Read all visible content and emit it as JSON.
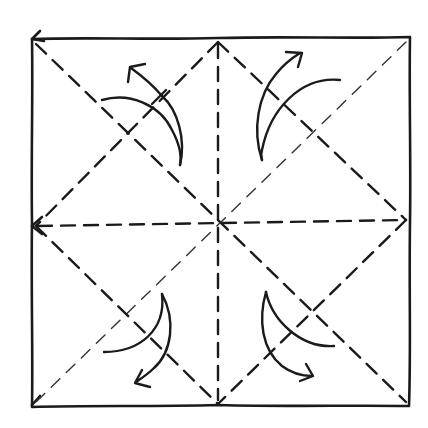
{
  "diagram": {
    "type": "origami-crease-pattern",
    "colors": {
      "ink": "#1a1a1a",
      "paper": "#ffffff"
    },
    "square": {
      "x1": 32,
      "y1": 38,
      "x2": 410,
      "y2": 406
    },
    "center": {
      "x": 218,
      "y": 220
    },
    "creases": [
      {
        "id": "diagonal-tl-br",
        "style": "heavy-dashed"
      },
      {
        "id": "diagonal-tr-bl",
        "style": "heavy-dashed"
      },
      {
        "id": "vertical-midline",
        "style": "heavy-dashed"
      },
      {
        "id": "horizontal-midline",
        "style": "heavy-dashed"
      },
      {
        "id": "diamond-top-left",
        "style": "mixed-dashed"
      },
      {
        "id": "diamond-top-right",
        "style": "mixed-dashed"
      },
      {
        "id": "diamond-bottom-left",
        "style": "mixed-dashed"
      },
      {
        "id": "diamond-bottom-right",
        "style": "mixed-dashed"
      }
    ],
    "arrows": [
      {
        "id": "fold-arrow-top-left",
        "direction": "up-left",
        "quadrant": "top-left"
      },
      {
        "id": "fold-arrow-top-right",
        "direction": "up-right",
        "quadrant": "top-right"
      },
      {
        "id": "fold-arrow-bottom-left",
        "direction": "down-left",
        "quadrant": "bottom-left"
      },
      {
        "id": "fold-arrow-bottom-right",
        "direction": "down-right",
        "quadrant": "bottom-right"
      }
    ]
  }
}
